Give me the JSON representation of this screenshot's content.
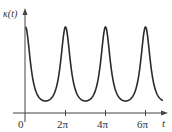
{
  "chart_data": {
    "type": "line",
    "title": "",
    "xlabel": "t",
    "ylabel": "κ(t)",
    "x_tick_labels": [
      "0",
      "2π",
      "4π",
      "6π"
    ],
    "x_tick_values": [
      0,
      6.2832,
      12.5664,
      18.8496
    ],
    "xlim": [
      0,
      20.5
    ],
    "grid": false,
    "legend": null,
    "series": [
      {
        "name": "κ(t)",
        "x": [
          0,
          0.5236,
          1.0472,
          1.5708,
          2.0944,
          2.618,
          3.1416,
          3.6652,
          4.1888,
          4.7124,
          5.236,
          5.7596,
          6.2832,
          6.8068,
          7.3304,
          7.854,
          8.3776,
          8.9012,
          9.4248,
          9.9484,
          10.472,
          10.9956,
          11.5192,
          12.0428,
          12.5664,
          13.09,
          13.6136,
          14.1372,
          14.6608,
          15.1844,
          15.708,
          16.2316,
          16.7552,
          17.2788,
          17.8024,
          18.326,
          18.8496,
          19.3732,
          19.8968,
          20.4204
        ],
        "y": [
          1.0,
          0.62,
          0.27,
          0.12,
          0.05,
          0.01,
          0.0,
          0.01,
          0.05,
          0.12,
          0.27,
          0.62,
          1.0,
          0.62,
          0.27,
          0.12,
          0.05,
          0.01,
          0.0,
          0.01,
          0.05,
          0.12,
          0.27,
          0.62,
          1.0,
          0.62,
          0.27,
          0.12,
          0.05,
          0.01,
          0.0,
          0.01,
          0.05,
          0.12,
          0.27,
          0.62,
          1.0,
          0.62,
          0.27,
          0.12
        ]
      }
    ],
    "curve_model": {
      "formula": "1/(1 - e*cos t)^p normalized",
      "e": 0.6,
      "p": 1.5
    }
  },
  "labels": {
    "y_axis": "κ(t)",
    "x_axis": "t",
    "origin": "0",
    "ticks": [
      "2π",
      "4π",
      "6π"
    ]
  },
  "colors": {
    "curve": "#2a2a2a",
    "axis": "#444444",
    "text": "#333333"
  }
}
